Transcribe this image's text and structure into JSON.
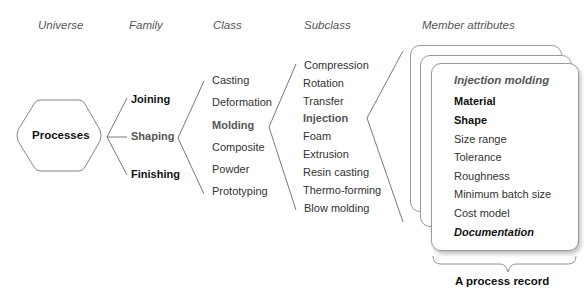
{
  "headers": {
    "universe": "Universe",
    "family": "Family",
    "class": "Class",
    "subclass": "Subclass",
    "member_attributes": "Member attributes"
  },
  "universe": {
    "label": "Processes"
  },
  "families": [
    {
      "label": "Joining",
      "style": "bold"
    },
    {
      "label": "Shaping",
      "style": "highlight"
    },
    {
      "label": "Finishing",
      "style": "bold"
    }
  ],
  "classes": [
    {
      "label": "Casting",
      "style": "normal"
    },
    {
      "label": "Deformation",
      "style": "normal"
    },
    {
      "label": "Molding",
      "style": "highlight"
    },
    {
      "label": "Composite",
      "style": "normal"
    },
    {
      "label": "Powder",
      "style": "normal"
    },
    {
      "label": "Prototyping",
      "style": "normal"
    }
  ],
  "subclasses": [
    {
      "label": "Compression",
      "style": "normal"
    },
    {
      "label": "Rotation",
      "style": "normal"
    },
    {
      "label": "Transfer",
      "style": "normal"
    },
    {
      "label": "Injection",
      "style": "highlight"
    },
    {
      "label": "Foam",
      "style": "normal"
    },
    {
      "label": "Extrusion",
      "style": "normal"
    },
    {
      "label": "Resin casting",
      "style": "normal"
    },
    {
      "label": "Thermo-forming",
      "style": "normal"
    },
    {
      "label": "Blow molding",
      "style": "normal"
    }
  ],
  "record": {
    "title": "Injection molding",
    "attributes": [
      {
        "label": "Material",
        "style": "bold"
      },
      {
        "label": "Shape",
        "style": "bold"
      },
      {
        "label": "Size range",
        "style": "normal"
      },
      {
        "label": "Tolerance",
        "style": "normal"
      },
      {
        "label": "Roughness",
        "style": "normal"
      },
      {
        "label": "Minimum batch size",
        "style": "normal"
      },
      {
        "label": "Cost model",
        "style": "normal"
      },
      {
        "label": "Documentation",
        "style": "bold-italic"
      }
    ],
    "caption": "A process record"
  },
  "colors": {
    "line": "#555555",
    "text": "#333333",
    "highlight_text": "#555555",
    "card_border": "#9a9a9a"
  }
}
